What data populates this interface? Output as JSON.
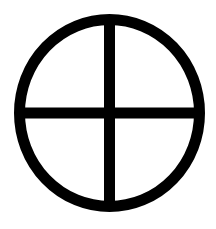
{
  "image": {
    "width": 216,
    "height": 229,
    "background": "#ffffff",
    "description": "Circle with cross (sun cross / earth symbol)"
  },
  "symbol": {
    "name": "sun-cross",
    "color": "#000000",
    "stroke_width": 11,
    "circle": {
      "cx": 109.5,
      "cy": 113,
      "rx": 90,
      "ry": 93.5
    },
    "vertical_bar": {
      "x": 109.5,
      "y1": 19,
      "y2": 207
    },
    "horizontal_bar": {
      "y": 113,
      "x1": 19,
      "x2": 200
    }
  }
}
